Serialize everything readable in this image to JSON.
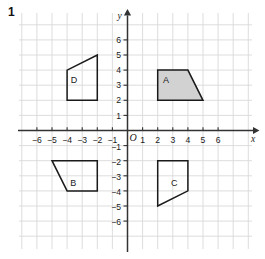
{
  "question_number": "1",
  "chart_data": {
    "type": "scatter",
    "title": "",
    "xlabel": "x",
    "ylabel": "y",
    "xlim": [
      -7,
      7
    ],
    "ylim": [
      -7,
      7
    ],
    "grid": true,
    "grid_color": "#d9d9d9",
    "axis_color": "#333333",
    "origin_label": "O",
    "x_ticks": [
      -6,
      -5,
      -4,
      -3,
      -2,
      -1,
      1,
      2,
      3,
      4,
      5,
      6
    ],
    "x_tick_labels": [
      "-6",
      "-5",
      "-4",
      "-3",
      "-2",
      "-1",
      "1",
      "2",
      "3",
      "4",
      "5",
      "6"
    ],
    "y_ticks": [
      6,
      5,
      4,
      3,
      2,
      1,
      -1,
      -2,
      -3,
      -4,
      -5,
      -6
    ],
    "y_tick_labels": [
      "6",
      "5",
      "4",
      "3",
      "2",
      "1",
      "-1",
      "-2",
      "-3",
      "-4",
      "-5",
      "-6"
    ],
    "shapes": [
      {
        "name": "A",
        "label": "A",
        "label_xy": [
          2.55,
          3.35
        ],
        "fill": "#d2d2d2",
        "stroke": "#1a1a1a",
        "vertices": [
          [
            2,
            2
          ],
          [
            2,
            4
          ],
          [
            4,
            4
          ],
          [
            5,
            2
          ]
        ]
      },
      {
        "name": "B",
        "label": "B",
        "label_xy": [
          -3.6,
          -3.45
        ],
        "fill": "none",
        "stroke": "#1a1a1a",
        "vertices": [
          [
            -5,
            -2
          ],
          [
            -2,
            -2
          ],
          [
            -2,
            -4
          ],
          [
            -4,
            -4
          ]
        ]
      },
      {
        "name": "C",
        "label": "C",
        "label_xy": [
          3.1,
          -3.45
        ],
        "fill": "none",
        "stroke": "#1a1a1a",
        "vertices": [
          [
            2,
            -2
          ],
          [
            4,
            -2
          ],
          [
            4,
            -4
          ],
          [
            2,
            -5
          ]
        ]
      },
      {
        "name": "D",
        "label": "D",
        "label_xy": [
          -3.55,
          3.35
        ],
        "fill": "none",
        "stroke": "#1a1a1a",
        "vertices": [
          [
            -4,
            2
          ],
          [
            -4,
            4
          ],
          [
            -2,
            5
          ],
          [
            -2,
            2
          ]
        ]
      }
    ]
  }
}
